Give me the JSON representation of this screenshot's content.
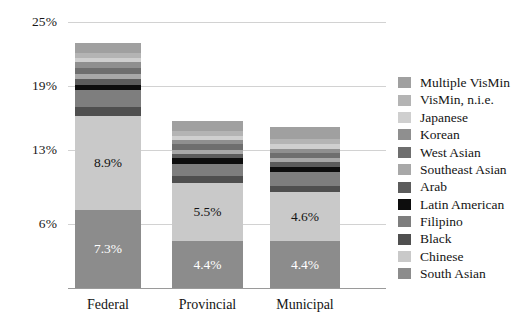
{
  "chart_data": {
    "type": "bar",
    "subtype": "stacked-bar",
    "title": "",
    "xlabel": "",
    "ylabel": "",
    "categories": [
      "Federal",
      "Provincial",
      "Municipal"
    ],
    "ylim": [
      0,
      25
    ],
    "yticks": [
      6,
      13,
      19,
      25
    ],
    "ytick_labels": [
      "6%",
      "13%",
      "19%",
      "25%"
    ],
    "grid": true,
    "legend_position": "right",
    "stack_order_bottom_up": [
      "South Asian",
      "Chinese",
      "Black",
      "Filipino",
      "Latin American",
      "Arab",
      "Southeast Asian",
      "West Asian",
      "Korean",
      "Japanese",
      "VisMin, n.i.e.",
      "Multiple VisMin"
    ],
    "series": [
      {
        "name": "South Asian",
        "color": "#8c8c8c",
        "values": [
          7.3,
          4.4,
          4.4
        ],
        "value_labels": [
          "7.3%",
          "4.4%",
          "4.4%"
        ]
      },
      {
        "name": "Chinese",
        "color": "#c9c9c9",
        "values": [
          8.9,
          5.5,
          4.6
        ],
        "value_labels": [
          "8.9%",
          "5.5%",
          "4.6%"
        ]
      },
      {
        "name": "Black",
        "color": "#4f4f4f",
        "values": [
          0.8,
          0.6,
          0.6
        ],
        "value_labels": [
          "",
          "",
          ""
        ]
      },
      {
        "name": "Filipino",
        "color": "#7e7e7e",
        "values": [
          1.6,
          1.2,
          1.3
        ],
        "value_labels": [
          "",
          "",
          ""
        ]
      },
      {
        "name": "Latin American",
        "color": "#0d0d0d",
        "values": [
          0.5,
          0.5,
          0.5
        ],
        "value_labels": [
          "",
          "",
          ""
        ]
      },
      {
        "name": "Arab",
        "color": "#5c5c5c",
        "values": [
          0.5,
          0.4,
          0.4
        ],
        "value_labels": [
          "",
          "",
          ""
        ]
      },
      {
        "name": "Southeast Asian",
        "color": "#a8a8a8",
        "values": [
          0.5,
          0.4,
          0.4
        ],
        "value_labels": [
          "",
          "",
          ""
        ]
      },
      {
        "name": "West Asian",
        "color": "#6e6e6e",
        "values": [
          0.6,
          0.5,
          0.5
        ],
        "value_labels": [
          "",
          "",
          ""
        ]
      },
      {
        "name": "Korean",
        "color": "#8f8f8f",
        "values": [
          0.5,
          0.4,
          0.4
        ],
        "value_labels": [
          "",
          "",
          ""
        ]
      },
      {
        "name": "Japanese",
        "color": "#cfcfcf",
        "values": [
          0.4,
          0.4,
          0.4
        ],
        "value_labels": [
          "",
          "",
          ""
        ]
      },
      {
        "name": "VisMin, n.i.e.",
        "color": "#b4b4b4",
        "values": [
          0.5,
          0.5,
          0.5
        ],
        "value_labels": [
          "",
          "",
          ""
        ]
      },
      {
        "name": "Multiple VisMin",
        "color": "#a0a0a0",
        "values": [
          0.9,
          0.9,
          1.1
        ],
        "value_labels": [
          "",
          "",
          ""
        ]
      }
    ],
    "bar_totals": [
      23.0,
      16.3,
      15.5
    ]
  },
  "axis": {
    "y_ticks": [
      {
        "label": "25%",
        "value": 25
      },
      {
        "label": "19%",
        "value": 19
      },
      {
        "label": "13%",
        "value": 13
      },
      {
        "label": "6%",
        "value": 6
      }
    ],
    "x_ticks": [
      {
        "label": "Federal"
      },
      {
        "label": "Provincial"
      },
      {
        "label": "Municipal"
      }
    ]
  },
  "legend": {
    "items": [
      {
        "label": "Multiple VisMin",
        "color": "#a0a0a0"
      },
      {
        "label": "VisMin, n.i.e.",
        "color": "#b4b4b4"
      },
      {
        "label": "Japanese",
        "color": "#cfcfcf"
      },
      {
        "label": "Korean",
        "color": "#8f8f8f"
      },
      {
        "label": "West Asian",
        "color": "#6e6e6e"
      },
      {
        "label": "Southeast Asian",
        "color": "#a8a8a8"
      },
      {
        "label": "Arab",
        "color": "#5c5c5c"
      },
      {
        "label": "Latin American",
        "color": "#0d0d0d"
      },
      {
        "label": "Filipino",
        "color": "#7e7e7e"
      },
      {
        "label": "Black",
        "color": "#4f4f4f"
      },
      {
        "label": "Chinese",
        "color": "#c9c9c9"
      },
      {
        "label": "South Asian",
        "color": "#8c8c8c"
      }
    ]
  },
  "colors": {
    "background": "#ffffff",
    "gridline": "#d2d2d2",
    "baseline": "#9a9a9a",
    "text": "#141414",
    "label_light": "#ffffff"
  }
}
